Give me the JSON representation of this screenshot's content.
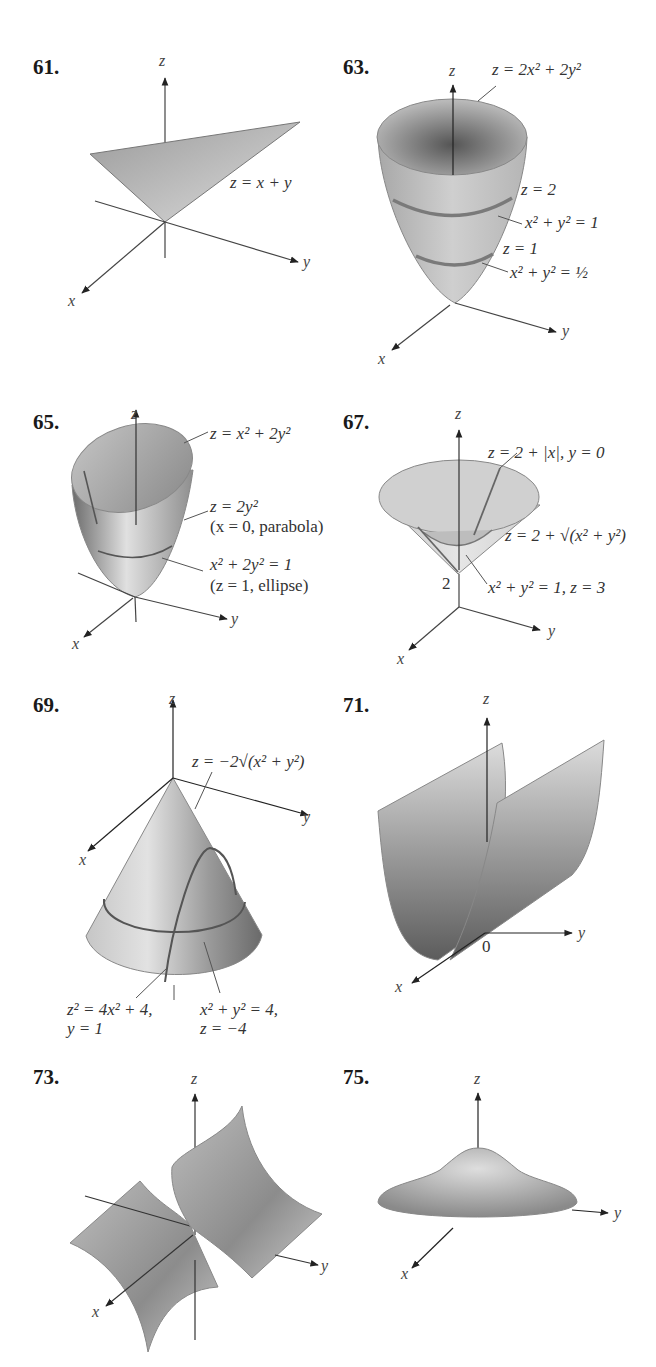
{
  "figures": [
    {
      "number": "61.",
      "surface": "plane",
      "axes": {
        "x": "x",
        "y": "y",
        "z": "z"
      },
      "labels": [
        "z = x + y"
      ]
    },
    {
      "number": "63.",
      "surface": "circular paraboloid",
      "axes": {
        "x": "x",
        "y": "y",
        "z": "z"
      },
      "labels": [
        "z = 2x² + 2y²",
        "z = 2",
        "x² + y² = 1",
        "z = 1",
        "x² + y² = ½"
      ]
    },
    {
      "number": "65.",
      "surface": "elliptic paraboloid",
      "axes": {
        "x": "x",
        "y": "y",
        "z": "z"
      },
      "labels": [
        "z = x² + 2y²",
        "z = 2y²",
        "(x = 0, parabola)",
        "x² + 2y² = 1",
        "(z = 1, ellipse)"
      ]
    },
    {
      "number": "67.",
      "surface": "cone shifted up",
      "axes": {
        "x": "x",
        "y": "y",
        "z": "z"
      },
      "tick": "2",
      "labels": [
        "z = 2 + |x|, y = 0",
        "z = 2 + √(x² + y²)",
        "x² + y² = 1, z = 3"
      ]
    },
    {
      "number": "69.",
      "surface": "downward cone",
      "axes": {
        "x": "x",
        "y": "y",
        "z": "z"
      },
      "labels": [
        "z = −2√(x² + y²)",
        "z² = 4x² + 4,",
        "y = 1",
        "x² + y² = 4,",
        "z = −4"
      ]
    },
    {
      "number": "71.",
      "surface": "parabolic cylinder",
      "axes": {
        "x": "x",
        "y": "y",
        "z": "z"
      },
      "origin": "0",
      "labels": []
    },
    {
      "number": "73.",
      "surface": "hyperbolic cylinder",
      "axes": {
        "x": "x",
        "y": "y",
        "z": "z"
      },
      "labels": []
    },
    {
      "number": "75.",
      "surface": "bell-shaped surface",
      "axes": {
        "x": "x",
        "y": "y",
        "z": "z"
      },
      "labels": []
    }
  ]
}
